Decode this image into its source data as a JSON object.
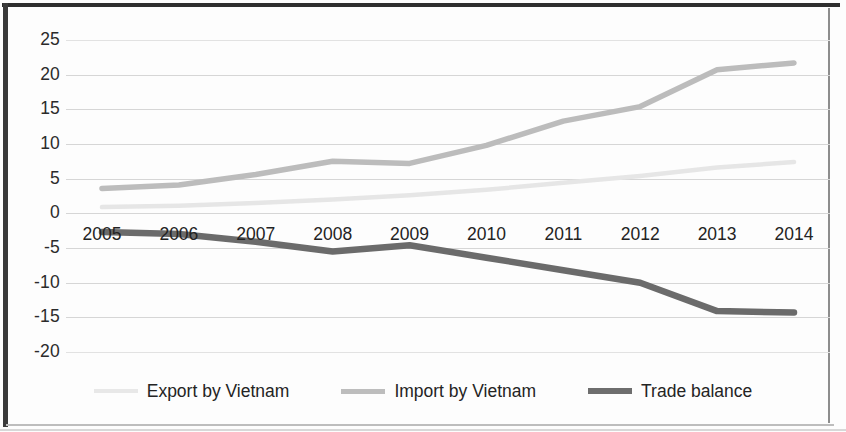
{
  "chart_data": {
    "type": "line",
    "title": "",
    "xlabel": "",
    "ylabel": "",
    "categories": [
      "2005",
      "2006",
      "2007",
      "2008",
      "2009",
      "2010",
      "2011",
      "2012",
      "2013",
      "2014"
    ],
    "ylim": [
      -20,
      25
    ],
    "ytick_labels": [
      "25",
      "20",
      "15",
      "10",
      "5",
      "0",
      "-5",
      "-10",
      "-15",
      "-20"
    ],
    "ytick_values": [
      25,
      20,
      15,
      10,
      5,
      0,
      -5,
      -10,
      -15,
      -20
    ],
    "grid": true,
    "legend_position": "bottom",
    "series": [
      {
        "name": "Export by Vietnam",
        "color": "#e6e6e6",
        "values": [
          0.9,
          1.1,
          1.5,
          2.0,
          2.6,
          3.4,
          4.4,
          5.4,
          6.6,
          7.4
        ]
      },
      {
        "name": "Import by Vietnam",
        "color": "#bcbcbc",
        "values": [
          3.6,
          4.1,
          5.6,
          7.5,
          7.2,
          9.8,
          13.3,
          15.4,
          20.7,
          21.7
        ]
      },
      {
        "name": "Trade balance",
        "color": "#6b6b6b",
        "values": [
          -2.7,
          -3.0,
          -4.1,
          -5.5,
          -4.6,
          -6.4,
          -8.2,
          -10.0,
          -14.1,
          -14.3
        ]
      }
    ]
  },
  "legend": {
    "items": [
      {
        "label": "Export by Vietnam"
      },
      {
        "label": "Import by Vietnam"
      },
      {
        "label": "Trade balance"
      }
    ]
  }
}
